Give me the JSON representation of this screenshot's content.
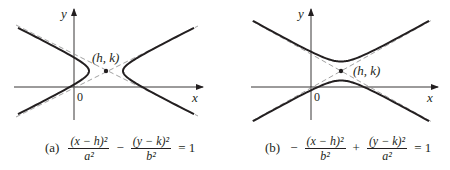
{
  "panels": [
    {
      "id": "a",
      "orientation": "horizontal",
      "axis_labels": {
        "x": "x",
        "y": "y",
        "origin": "0"
      },
      "center_label": "(h, k)",
      "caption": {
        "tag": "(a)",
        "term1_num": "(x − h)²",
        "term1_den": "a²",
        "op": "−",
        "term2_num": "(y − k)²",
        "term2_den": "b²",
        "rhs": "= 1"
      },
      "geometry": {
        "center": [
          106,
          71
        ],
        "a": 17,
        "b": 8.5,
        "x_axis_y": 87,
        "y_axis_x": 74
      }
    },
    {
      "id": "b",
      "orientation": "vertical",
      "axis_labels": {
        "x": "x",
        "y": "y",
        "origin": "0"
      },
      "center_label": "(h, k)",
      "caption": {
        "tag": "(b)",
        "lead": "−",
        "term1_num": "(x − h)²",
        "term1_den": "b²",
        "op": "+",
        "term2_num": "(y − k)²",
        "term2_den": "a²",
        "rhs": "= 1"
      },
      "geometry": {
        "center": [
          341,
          71
        ],
        "a": 9.5,
        "b": 17,
        "x_axis_y": 87,
        "y_axis_x": 311
      }
    }
  ],
  "colors": {
    "curve": "#231f20",
    "asymptote": "#8a8a8a",
    "axis": "#231f20"
  }
}
